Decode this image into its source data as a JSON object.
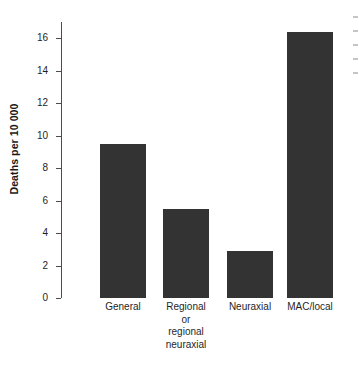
{
  "chart_data": {
    "type": "bar",
    "title": "",
    "subtitle": "",
    "xlabel": "",
    "ylabel": "Deaths per 10 000",
    "categories": [
      "General",
      "Regional or regional neuraxial",
      "Neuraxial",
      "MAC/local"
    ],
    "category_lines": [
      [
        "General"
      ],
      [
        "Regional",
        "or",
        "regional",
        "neuraxial"
      ],
      [
        "Neuraxial"
      ],
      [
        "MAC/local"
      ]
    ],
    "values": [
      9.5,
      5.5,
      2.9,
      16.4
    ],
    "ylim": [
      0,
      17
    ],
    "yticks": [
      0,
      2,
      4,
      6,
      8,
      10,
      12,
      14,
      16
    ],
    "ytick_labels": [
      "0",
      "2",
      "4",
      "6",
      "8",
      "10",
      "12",
      "14",
      "16"
    ],
    "grid": false,
    "legend": false,
    "legend_position": "none",
    "bar_color": "#333333",
    "axis_color": "#4d4d4d",
    "text_color": "#1f1f1f",
    "background_color": "#ffffff",
    "annotations": []
  }
}
